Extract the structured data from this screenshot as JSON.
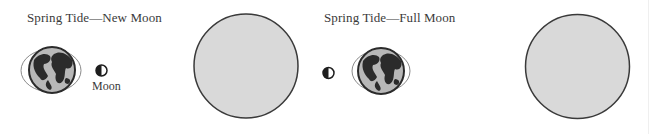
{
  "panels": [
    {
      "title": "Spring Tide—New Moon",
      "moon_label": "Moon"
    },
    {
      "title": "Spring Tide—Full Moon"
    }
  ],
  "colors": {
    "sun_fill": "#d9d9d9",
    "sun_stroke": "#3a3a3a",
    "earth_ocean": "#b8b8b8",
    "earth_land": "#2b2b2b",
    "ellipse_stroke": "#8a8a8a",
    "text": "#3a3a3a"
  },
  "icons": {
    "sun": "sun-disk",
    "earth": "earth-globe-with-tidal-bulge",
    "moon": "half-moon"
  }
}
